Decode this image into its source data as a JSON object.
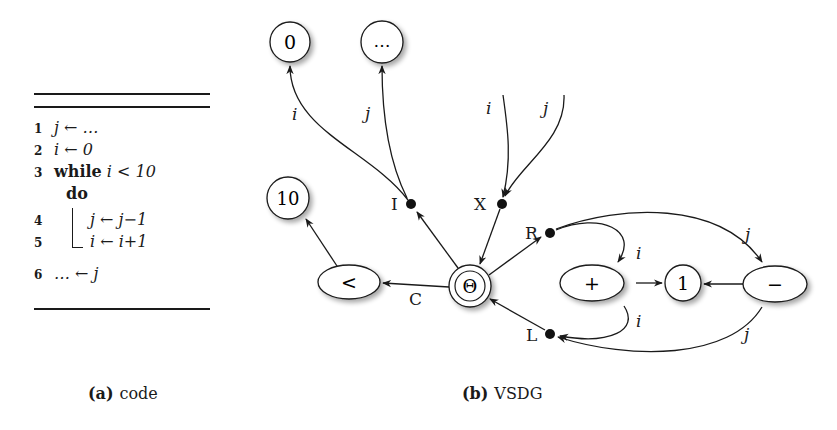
{
  "code_panel": {
    "lines": [
      {
        "no": "1",
        "text": "j ← …"
      },
      {
        "no": "2",
        "text": "i ← 0"
      },
      {
        "no": "3",
        "keyword": "while",
        "text": "i < 10"
      },
      {
        "no": "",
        "keyword": "do",
        "text": ""
      },
      {
        "no": "4",
        "text": "j ← j−1"
      },
      {
        "no": "5",
        "text": "i ← i+1"
      },
      {
        "no": "6",
        "text": "… ← j"
      }
    ]
  },
  "captions": {
    "a_label": "(a)",
    "a_text": "code",
    "b_label": "(b)",
    "b_text": "VSDG"
  },
  "graph": {
    "nodes": {
      "zero": "0",
      "dots": "…",
      "ten": "10",
      "less": "<",
      "theta": "Θ",
      "plus": "+",
      "one": "1",
      "minus": "−"
    },
    "ports": {
      "I": "I",
      "X": "X",
      "R": "R",
      "L": "L",
      "C": "C"
    },
    "edge_labels": {
      "i_to_zero": "i",
      "j_to_dots": "j",
      "x_in_i": "i",
      "x_in_j": "j",
      "r_to_plus": "i",
      "r_to_minus": "j",
      "plus_to_l": "i",
      "minus_to_l": "j"
    }
  }
}
